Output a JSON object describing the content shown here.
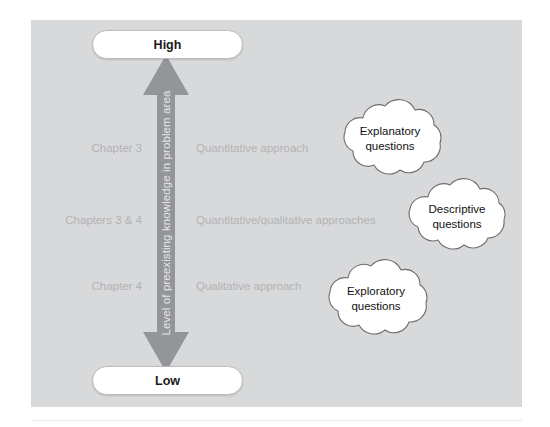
{
  "figure": {
    "panel_color": "#d8d9da",
    "arrow_color": "#939598",
    "muted_text_color": "#b1b3b5"
  },
  "axis": {
    "caption": "Level of preexisting knowledge in problem area",
    "top_label": "High",
    "bottom_label": "Low"
  },
  "tiers": [
    {
      "chapter": "Chapter 3",
      "approach": "Quantitative approach"
    },
    {
      "chapter": "Chapters 3 & 4",
      "approach": "Quantitative/qualitative approaches"
    },
    {
      "chapter": "Chapter 4",
      "approach": "Qualitative approach"
    }
  ],
  "clouds": [
    {
      "line1": "Explanatory",
      "line2": "questions"
    },
    {
      "line1": "Descriptive",
      "line2": "questions"
    },
    {
      "line1": "Exploratory",
      "line2": "questions"
    }
  ]
}
